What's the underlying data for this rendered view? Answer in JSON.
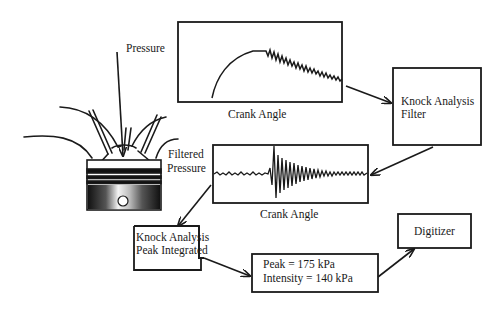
{
  "diagram": {
    "colors": {
      "stroke": "#1a1a1a",
      "background": "#ffffff"
    },
    "labels": {
      "pressure": "Pressure",
      "filtered_pressure_line1": "Filtered",
      "filtered_pressure_line2": "Pressure",
      "crank_angle_top": "Crank Angle",
      "crank_angle_middle": "Crank Angle"
    },
    "nodes": {
      "piston": {
        "label": "Engine cylinder / piston",
        "icon": "piston-icon"
      },
      "raw_pressure_plot": {
        "caption": "Crank Angle",
        "trace": "raw cylinder pressure with knock ripple"
      },
      "filter": {
        "line1": "Knock Analysis",
        "line2": "Filter"
      },
      "filtered_plot": {
        "caption": "Crank Angle",
        "trace": "band-pass filtered knock oscillation"
      },
      "peak_integrated": {
        "line1": "Knock Analysis",
        "line2": "Peak Integrated"
      },
      "result": {
        "line1": "Peak = 175 kPa",
        "line2": "Intensity = 140 kPa"
      },
      "digitizer": {
        "label": "Digitizer"
      }
    },
    "results": {
      "peak_kpa": 175,
      "intensity_kpa": 140,
      "unit": "kPa"
    },
    "edges": [
      {
        "from": "pressure-label",
        "to": "piston"
      },
      {
        "from": "raw_pressure_plot",
        "to": "filter"
      },
      {
        "from": "filter",
        "to": "filtered_plot"
      },
      {
        "from": "filtered_plot",
        "to": "peak_integrated"
      },
      {
        "from": "peak_integrated",
        "to": "result"
      },
      {
        "from": "result",
        "to": "digitizer"
      }
    ]
  }
}
